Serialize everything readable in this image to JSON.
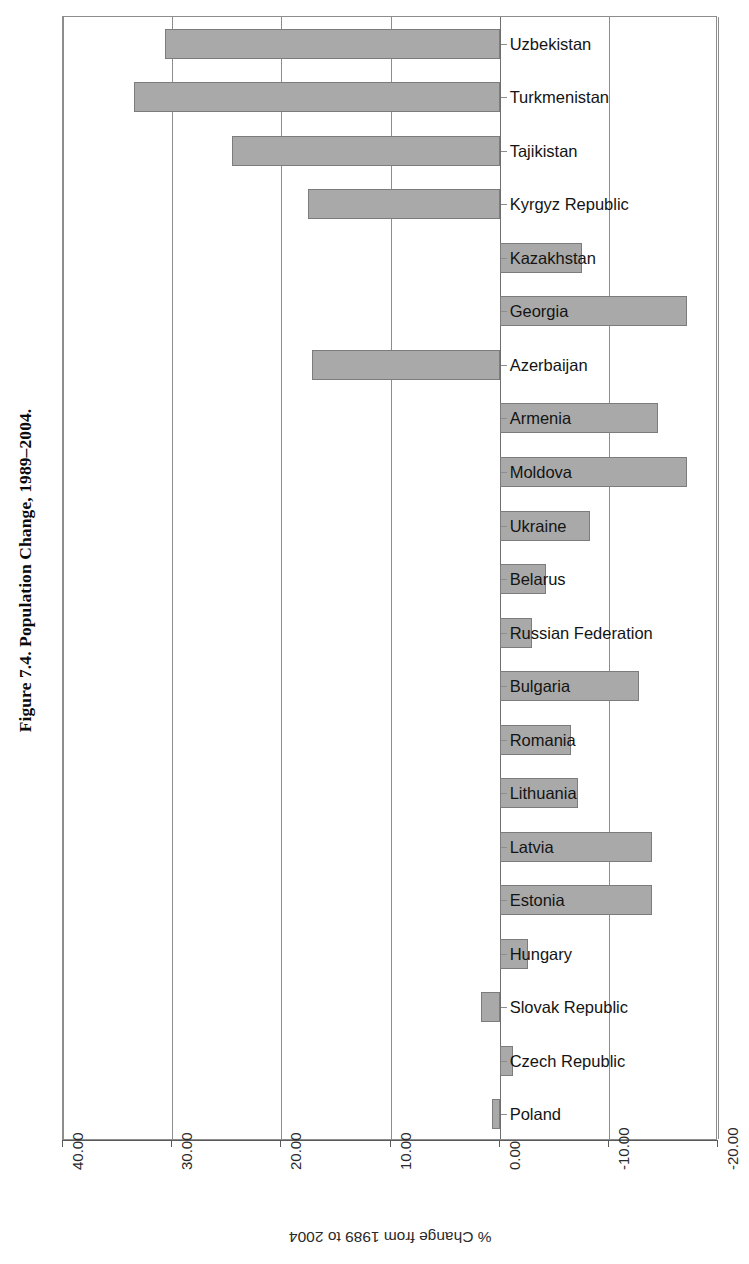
{
  "figure": {
    "title": "Figure 7.4.  Population Change, 1989–2004."
  },
  "axis": {
    "x_title": "% Change from 1989 to 2004",
    "ticks": [
      "40.00",
      "30.00",
      "20.00",
      "10.00",
      "0.00",
      "-10.00",
      "-20.00"
    ]
  },
  "colors": {
    "bar_fill": "#a9a9a9",
    "bar_stroke": "#7c7c7c",
    "grid": "#8d8d8d",
    "text": "#141414"
  },
  "chart_data": {
    "type": "bar",
    "orientation": "horizontal",
    "title": "Figure 7.4.  Population Change, 1989–2004.",
    "xlabel": "% Change from 1989 to 2004",
    "ylabel": "",
    "xlim": [
      40.0,
      -20.0
    ],
    "xticks": [
      40.0,
      30.0,
      20.0,
      10.0,
      0.0,
      -10.0,
      -20.0
    ],
    "grid": true,
    "legend": false,
    "categories": [
      "Uzbekistan",
      "Turkmenistan",
      "Tajikistan",
      "Kyrgyz Republic",
      "Kazakhstan",
      "Georgia",
      "Azerbaijan",
      "Armenia",
      "Moldova",
      "Ukraine",
      "Belarus",
      "Russian Federation",
      "Bulgaria",
      "Romania",
      "Lithuania",
      "Latvia",
      "Estonia",
      "Hungary",
      "Slovak Republic",
      "Czech Republic",
      "Poland"
    ],
    "values": [
      30.7,
      33.5,
      24.5,
      17.6,
      -7.5,
      -17.2,
      17.2,
      -14.5,
      -17.2,
      -8.3,
      -4.2,
      -3.0,
      -12.8,
      -6.5,
      -7.2,
      -14.0,
      -14.0,
      -2.6,
      1.7,
      -1.2,
      0.7
    ]
  }
}
